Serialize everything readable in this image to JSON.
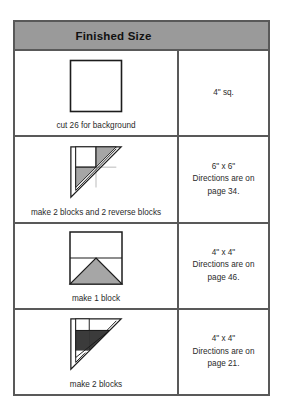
{
  "header": {
    "title": "Finished Size"
  },
  "colors": {
    "header_background": "#9a9a9a",
    "border": "#595959",
    "light_shade": "#ffffff",
    "medium_shade": "#a6a6a6",
    "dark_shade": "#3b3b3b",
    "page_background": "#ffffff",
    "text": "#2a2a2a"
  },
  "rows": [
    {
      "diagram": "plain-square-block",
      "caption": "cut 26 for background",
      "size": "4\" sq."
    },
    {
      "diagram": "corner-triangle-block",
      "caption": "make 2 blocks and 2 reverse blocks",
      "size": "6\" x 6\"\nDirections are on\npage 34."
    },
    {
      "diagram": "peak-triangle-block",
      "caption": "make 1 block",
      "size": "4\" x 4\"\nDirections are on\npage 46."
    },
    {
      "diagram": "dark-corner-triangle-block",
      "caption": "make 2 blocks",
      "size": "4\" x 4\"\nDirections are on\npage 21."
    }
  ]
}
